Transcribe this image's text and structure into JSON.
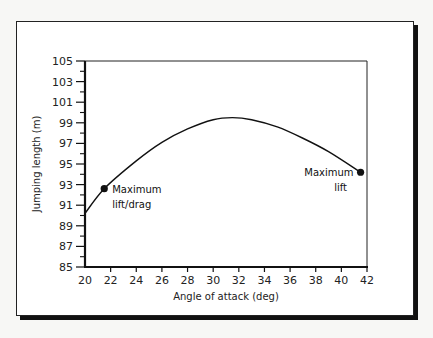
{
  "chart_data": {
    "type": "line",
    "title": "",
    "xlabel": "Angle of attack (deg)",
    "ylabel": "Jumping length (m)",
    "xlim": [
      20,
      42
    ],
    "ylim": [
      85,
      105
    ],
    "x_ticks": [
      20,
      22,
      24,
      26,
      28,
      30,
      32,
      34,
      36,
      38,
      40,
      42
    ],
    "y_ticks_labeled": [
      85,
      87,
      89,
      91,
      93,
      95,
      97,
      99,
      101,
      103,
      105
    ],
    "y_ticks_minor": [
      86,
      88,
      90,
      92,
      94,
      96,
      98,
      100,
      102,
      104
    ],
    "grid": false,
    "legend": null,
    "series": [
      {
        "name": "Jumping length",
        "x": [
          20,
          21.5,
          24,
          26,
          28,
          30,
          31.5,
          33,
          35,
          37,
          39,
          41.5
        ],
        "values": [
          90.2,
          92.6,
          95.3,
          97.1,
          98.4,
          99.3,
          99.5,
          99.3,
          98.6,
          97.5,
          96.2,
          94.2
        ]
      }
    ],
    "annotations": [
      {
        "text": [
          "Maximum",
          "lift/drag"
        ],
        "x": 21.5,
        "y": 92.6
      },
      {
        "text": [
          "Maximum",
          "lift"
        ],
        "x": 41.5,
        "y": 94.2
      }
    ]
  }
}
